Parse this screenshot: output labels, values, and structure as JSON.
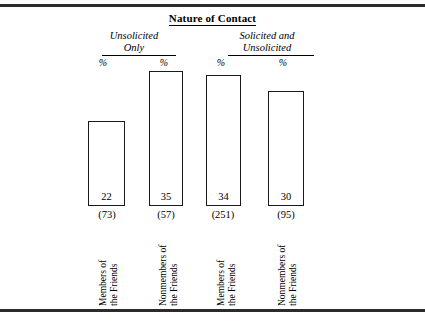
{
  "figure": {
    "title": "Nature of Contact"
  },
  "chart_data": {
    "type": "bar",
    "title": "Nature of Contact",
    "xlabel": "",
    "ylabel": "%",
    "ylim": [
      0,
      40
    ],
    "grid": false,
    "legend": "none",
    "unit_label": "%",
    "groups": [
      {
        "label_line1": "Unsolicited",
        "label_line2": "Only"
      },
      {
        "label_line1": "Solicited and",
        "label_line2": "Unsolicited"
      }
    ],
    "categories": [
      "Members of the Friends",
      "Nonmembers of the Friends",
      "Members of the Friends",
      "Nonmembers of the Friends"
    ],
    "values": [
      22,
      35,
      34,
      30
    ],
    "n_values": [
      "(73)",
      "(57)",
      "(251)",
      "(95)"
    ],
    "bars": [
      {
        "group": "Unsolicited Only",
        "value": 22,
        "value_label": "22",
        "n_label": "(73)",
        "pct_marker": "%",
        "cat_line1": "Members of",
        "cat_line2": "the Friends"
      },
      {
        "group": "Unsolicited Only",
        "value": 35,
        "value_label": "35",
        "n_label": "(57)",
        "pct_marker": "%",
        "cat_line1": "Nonmembers of",
        "cat_line2": "the Friends"
      },
      {
        "group": "Solicited and Unsolicited",
        "value": 34,
        "value_label": "34",
        "n_label": "(251)",
        "pct_marker": "%",
        "cat_line1": "Members of",
        "cat_line2": "the Friends"
      },
      {
        "group": "Solicited and Unsolicited",
        "value": 30,
        "value_label": "30",
        "n_label": "(95)",
        "pct_marker": "%",
        "cat_line1": "Nonmembers of",
        "cat_line2": "the Friends"
      }
    ]
  },
  "layout": {
    "bar_left": [
      88,
      149,
      206,
      268
    ],
    "bar_width": [
      37,
      34,
      35,
      36
    ],
    "baseline_y": 206,
    "px_per_unit": 3.85,
    "pct_left": [
      92,
      153,
      210,
      272
    ],
    "n_left": [
      81,
      140,
      197,
      260
    ],
    "cat_left": [
      98,
      158,
      216,
      277
    ]
  },
  "colors": {
    "ink": "#000000",
    "rule": "#2b2b2b",
    "bar_stroke": "#1a1a1a",
    "bar_fill": "#ffffff",
    "background": "#ffffff"
  }
}
